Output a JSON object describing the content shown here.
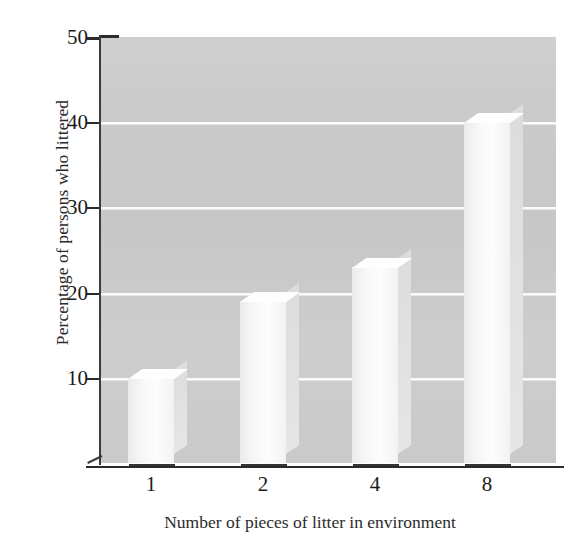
{
  "chart_data": {
    "type": "bar",
    "title": "",
    "xlabel": "Number of pieces of litter in environment",
    "ylabel": "Percentage of persons who littered",
    "categories": [
      "1",
      "2",
      "4",
      "8"
    ],
    "values": [
      10,
      19,
      23,
      40
    ],
    "ylim": [
      0,
      50
    ],
    "yticks": [
      0,
      10,
      20,
      30,
      40,
      50
    ],
    "ytick_labels": [
      "10",
      "20",
      "30",
      "40",
      "50"
    ],
    "grid": true,
    "legend": "none",
    "style": "3d-bar",
    "colors": {
      "plot_background": "#cfcfcf",
      "bar_face": "#f8f8f8",
      "bar_side": "#e0e0e0",
      "gridline": "#fbfbfb",
      "axis": "#2b2b2b",
      "text": "#1b1b1b",
      "page_background": "#ffffff"
    }
  }
}
